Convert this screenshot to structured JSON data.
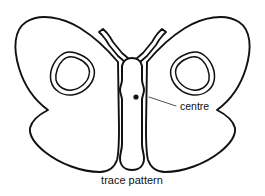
{
  "figure": {
    "background_color": "#ffffff",
    "line_color": "#111111",
    "leader_color": "#555555",
    "caption": "trace pattern",
    "caption_position": "bottom-center"
  },
  "annotations": {
    "centre": {
      "label": "centre",
      "marker": "filled-dot",
      "marker_x": 136,
      "marker_y": 97,
      "leader_from_x": 149,
      "leader_from_y": 97,
      "leader_to_x": 176,
      "leader_to_y": 106
    }
  },
  "parts": {
    "left_wing_label": "left wing outline",
    "right_wing_label": "right wing outline",
    "left_spot_label": "left wing eyespot",
    "right_spot_label": "right wing eyespot",
    "body_label": "butterfly body",
    "left_antenna_label": "left antenna",
    "right_antenna_label": "right antenna"
  }
}
